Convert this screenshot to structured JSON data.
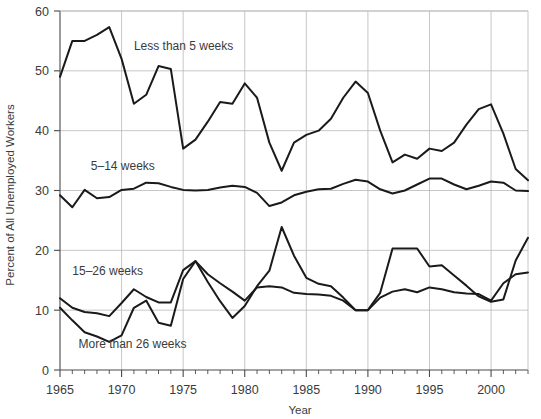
{
  "chart_data": {
    "type": "line",
    "title": "",
    "xlabel": "Year",
    "ylabel": "Percent of All Unemployed Workers",
    "xlim": [
      1965,
      2003
    ],
    "ylim": [
      0,
      60
    ],
    "grid": true,
    "legend_position": "inline-annotations",
    "x": [
      1965,
      1966,
      1967,
      1968,
      1969,
      1970,
      1971,
      1972,
      1973,
      1974,
      1975,
      1976,
      1977,
      1978,
      1979,
      1980,
      1981,
      1982,
      1983,
      1984,
      1985,
      1986,
      1987,
      1988,
      1989,
      1990,
      1991,
      1992,
      1993,
      1994,
      1995,
      1996,
      1997,
      1998,
      1999,
      2000,
      2001,
      2002,
      2003
    ],
    "xticks": [
      1965,
      1970,
      1975,
      1980,
      1985,
      1990,
      1995,
      2000
    ],
    "xtick_labels": [
      "1965",
      "1970",
      "1975",
      "1980",
      "1985",
      "1990",
      "1995",
      "2000"
    ],
    "yticks": [
      0,
      10,
      20,
      30,
      40,
      50,
      60
    ],
    "ytick_labels": [
      "0",
      "10",
      "20",
      "30",
      "40",
      "50",
      "60"
    ],
    "series": [
      {
        "name": "Less than 5 weeks",
        "label_x": 1971.0,
        "label_y": 53.5,
        "values": [
          49.0,
          55.0,
          55.0,
          56.0,
          57.3,
          52.0,
          44.5,
          46.0,
          50.8,
          50.3,
          37.0,
          38.5,
          41.5,
          44.8,
          44.5,
          47.9,
          45.5,
          38.0,
          33.3,
          38.0,
          39.3,
          40.0,
          42.0,
          45.5,
          48.2,
          46.3,
          40.0,
          34.7,
          36.0,
          35.3,
          37.0,
          36.6,
          38.0,
          41.0,
          43.6,
          44.4,
          39.5,
          33.6,
          31.7
        ]
      },
      {
        "name": "5–14 weeks",
        "label_x": 1967.5,
        "label_y": 33.5,
        "values": [
          29.2,
          27.2,
          30.1,
          28.7,
          28.9,
          30.1,
          30.3,
          31.3,
          31.2,
          30.6,
          30.1,
          30.0,
          30.1,
          30.5,
          30.8,
          30.6,
          29.6,
          27.4,
          28.0,
          29.2,
          29.8,
          30.2,
          30.3,
          31.1,
          31.8,
          31.5,
          30.2,
          29.5,
          30.0,
          31.0,
          32.0,
          32.0,
          31.0,
          30.2,
          30.8,
          31.5,
          31.3,
          30.0,
          29.9
        ]
      },
      {
        "name": "15–26 weeks",
        "label_x": 1966.0,
        "label_y": 15.8,
        "values": [
          12.0,
          10.4,
          9.7,
          9.5,
          9.0,
          11.2,
          13.5,
          12.2,
          11.3,
          11.3,
          16.7,
          18.2,
          16.0,
          14.5,
          13.1,
          11.6,
          13.8,
          14.0,
          13.8,
          12.9,
          12.7,
          12.6,
          12.4,
          11.6,
          10.0,
          10.0,
          12.1,
          13.1,
          13.5,
          13.0,
          13.8,
          13.5,
          13.0,
          12.8,
          12.7,
          11.6,
          14.5,
          16.0,
          16.3
        ]
      },
      {
        "name": "More than 26 weeks",
        "label_x": 1966.5,
        "label_y": 3.6,
        "values": [
          10.4,
          8.3,
          6.3,
          5.6,
          4.7,
          5.8,
          10.4,
          11.6,
          7.9,
          7.4,
          15.2,
          18.2,
          14.7,
          11.5,
          8.7,
          10.7,
          14.0,
          16.6,
          23.9,
          19.1,
          15.4,
          14.4,
          14.0,
          12.1,
          10.0,
          10.0,
          12.9,
          20.3,
          20.3,
          20.3,
          17.3,
          17.5,
          15.8,
          14.1,
          12.3,
          11.4,
          11.8,
          18.3,
          22.1
        ]
      }
    ]
  },
  "axis": {
    "y_title": "Percent of All Unemployed Workers",
    "x_title": "Year"
  }
}
